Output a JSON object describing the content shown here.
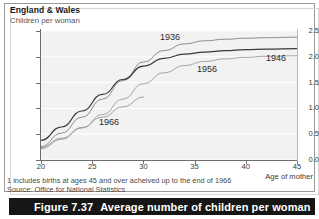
{
  "panel": {
    "region_title": "England & Wales",
    "y_axis_title": "Children per woman"
  },
  "footnotes": {
    "note_1": "1 includes births at ages 45 and over acheived up to the end of 1966",
    "source": "Source: Office for National Statistics"
  },
  "caption": {
    "number": "Figure 7.37",
    "text": "Average number of children per woman"
  },
  "colors": {
    "plot_background": "#f2f2f2",
    "axis": "#6e6e6e",
    "gridline": "#ffffff",
    "series_1936": "#8c8c8c",
    "series_1946": "#3a3a3a",
    "series_1956": "#a5a5a5",
    "series_1966": "#9e9e9e",
    "caption_background": "#161616",
    "caption_text": "#ffffff"
  },
  "chart_data": {
    "type": "line",
    "title": "Average number of children per woman",
    "subtitle": "England & Wales",
    "xlabel": "Age of mother",
    "ylabel": "Children per woman",
    "xlim": [
      20,
      45
    ],
    "ylim": [
      0.0,
      2.5
    ],
    "xticks": [
      20,
      25,
      30,
      35,
      40,
      45
    ],
    "yticks": [
      0.0,
      0.5,
      1.0,
      1.5,
      2.0,
      2.5
    ],
    "grid": true,
    "legend": "inline-labels",
    "x": [
      20,
      22,
      24,
      26,
      28,
      30,
      32,
      34,
      36,
      38,
      40,
      42,
      45
    ],
    "series": [
      {
        "name": "1936",
        "label": "1936",
        "color": "#8c8c8c",
        "values": [
          0.26,
          0.52,
          0.83,
          1.18,
          1.54,
          1.9,
          2.12,
          2.25,
          2.31,
          2.34,
          2.36,
          2.37,
          2.38
        ]
      },
      {
        "name": "1946",
        "label": "1946",
        "color": "#3a3a3a",
        "values": [
          0.38,
          0.64,
          0.95,
          1.27,
          1.56,
          1.82,
          1.97,
          2.05,
          2.09,
          2.12,
          2.14,
          2.15,
          2.16
        ]
      },
      {
        "name": "1956",
        "label": "1956",
        "color": "#a5a5a5",
        "values": [
          0.22,
          0.4,
          0.62,
          0.88,
          1.18,
          1.48,
          1.69,
          1.83,
          1.91,
          1.96,
          1.99,
          2.01,
          2.02
        ]
      },
      {
        "name": "1966",
        "label": "1966",
        "color": "#9e9e9e",
        "values": [
          0.24,
          0.42,
          0.63,
          0.83,
          1.03,
          1.22,
          null,
          null,
          null,
          null,
          null,
          null,
          null
        ]
      }
    ]
  },
  "axis_ticks": {
    "y": [
      "2.5",
      "2.0",
      "1.5",
      "1.0",
      "0.5",
      "0.0"
    ],
    "x": [
      "20",
      "25",
      "30",
      "35",
      "40",
      "45"
    ]
  },
  "series_labels": [
    {
      "text": "1936",
      "left": 160,
      "top": 32
    },
    {
      "text": "1946",
      "left": 266,
      "top": 53
    },
    {
      "text": "1956",
      "left": 197,
      "top": 64
    },
    {
      "text": "1966",
      "left": 99,
      "top": 117
    }
  ]
}
